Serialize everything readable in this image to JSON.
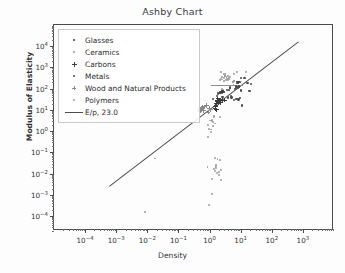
{
  "chart_data": {
    "type": "scatter",
    "title": "Ashby Chart",
    "xlabel": "Density",
    "ylabel": "Modulus of Elasticity",
    "xscale": "log",
    "yscale": "log",
    "xlim": [
      1e-05,
      10000
    ],
    "ylim": [
      2e-05,
      100000
    ],
    "grid": false,
    "legend_position": "upper left",
    "xticks": [
      {
        "value": 0.0001,
        "label": "10",
        "exp": "−4"
      },
      {
        "value": 0.001,
        "label": "10",
        "exp": "−3"
      },
      {
        "value": 0.01,
        "label": "10",
        "exp": "−2"
      },
      {
        "value": 0.1,
        "label": "10",
        "exp": "−1"
      },
      {
        "value": 1,
        "label": "10",
        "exp": "0"
      },
      {
        "value": 10,
        "label": "10",
        "exp": "1"
      },
      {
        "value": 100,
        "label": "10",
        "exp": "2"
      },
      {
        "value": 1000,
        "label": "10",
        "exp": "3"
      }
    ],
    "yticks": [
      {
        "value": 0.0001,
        "label": "10",
        "exp": "−4"
      },
      {
        "value": 0.001,
        "label": "10",
        "exp": "−3"
      },
      {
        "value": 0.01,
        "label": "10",
        "exp": "−2"
      },
      {
        "value": 0.1,
        "label": "10",
        "exp": "−1"
      },
      {
        "value": 1,
        "label": "10",
        "exp": "0"
      },
      {
        "value": 10,
        "label": "10",
        "exp": "1"
      },
      {
        "value": 100,
        "label": "10",
        "exp": "2"
      },
      {
        "value": 1000,
        "label": "10",
        "exp": "3"
      },
      {
        "value": 10000,
        "label": "10",
        "exp": "4"
      }
    ],
    "legend": [
      {
        "label": "Glasses",
        "marker": "dot",
        "color": "#3f3f3f",
        "size": 2.2
      },
      {
        "label": "Ceramics",
        "marker": "dot",
        "color": "#9a9a9a",
        "size": 1.8
      },
      {
        "label": "Carbons",
        "marker": "plus",
        "color": "#3a3a3a",
        "size": 5.0
      },
      {
        "label": "Metals",
        "marker": "dot",
        "color": "#4a4a4a",
        "size": 2.4
      },
      {
        "label": "Wood and Natural Products",
        "marker": "plus",
        "color": "#8a8a8a",
        "size": 4.6
      },
      {
        "label": "Polymers",
        "marker": "dot",
        "color": "#9e9e9e",
        "size": 1.9
      },
      {
        "label": "E/p, 23.0",
        "marker": "line",
        "color": "#4c4c4c",
        "size": 0
      }
    ],
    "guide_line": {
      "label": "E/p, 23.0",
      "slope_ratio": 23.0,
      "x_start": 0.0006,
      "y_start": 0.0026,
      "x_end": 700,
      "y_end": 16000,
      "color": "#4c4c4c"
    },
    "horizontal_marker": {
      "y": 150,
      "x_start": 1.1,
      "x_end": 12.0,
      "color": "#8e8e8e"
    },
    "series": [
      {
        "name": "Metals",
        "marker": "dot",
        "color": "#4a4a4a",
        "size": 2.3,
        "points": [
          [
            1.74,
            45
          ],
          [
            1.85,
            60
          ],
          [
            2.7,
            70
          ],
          [
            2.7,
            73
          ],
          [
            2.71,
            69
          ],
          [
            2.8,
            72
          ],
          [
            2.81,
            71
          ],
          [
            4.43,
            110
          ],
          [
            4.51,
            116
          ],
          [
            4.54,
            105
          ],
          [
            6.5,
            95
          ],
          [
            7.1,
            128
          ],
          [
            7.2,
            105
          ],
          [
            7.8,
            200
          ],
          [
            7.85,
            207
          ],
          [
            7.87,
            211
          ],
          [
            7.9,
            193
          ],
          [
            7.95,
            200
          ],
          [
            8.0,
            190
          ],
          [
            8.05,
            205
          ],
          [
            8.1,
            117
          ],
          [
            8.3,
            120
          ],
          [
            8.4,
            115
          ],
          [
            8.9,
            125
          ],
          [
            8.93,
            130
          ],
          [
            8.96,
            117
          ],
          [
            9.2,
            200
          ],
          [
            10.2,
            327
          ],
          [
            10.5,
            83
          ],
          [
            11.3,
            16
          ],
          [
            13.3,
            310
          ],
          [
            16.6,
            185
          ],
          [
            19.3,
            79
          ],
          [
            21.4,
            172
          ],
          [
            1.3,
            33
          ],
          [
            2.6,
            42
          ],
          [
            4.8,
            45
          ],
          [
            5.1,
            38
          ],
          [
            6.2,
            30
          ],
          [
            7.3,
            32
          ],
          [
            8.6,
            31
          ],
          [
            9.6,
            37
          ],
          [
            3.9,
            39
          ]
        ]
      },
      {
        "name": "Ceramics",
        "marker": "dot",
        "color": "#9a9a9a",
        "size": 1.9,
        "points": [
          [
            2.3,
            300
          ],
          [
            2.5,
            350
          ],
          [
            3.0,
            330
          ],
          [
            3.1,
            400
          ],
          [
            3.2,
            380
          ],
          [
            3.21,
            410
          ],
          [
            3.25,
            450
          ],
          [
            3.5,
            370
          ],
          [
            3.8,
            300
          ],
          [
            3.9,
            390
          ],
          [
            3.95,
            420
          ],
          [
            4.0,
            250
          ],
          [
            4.1,
            280
          ],
          [
            5.6,
            210
          ],
          [
            5.68,
            205
          ],
          [
            6.0,
            220
          ],
          [
            6.1,
            230
          ],
          [
            2.2,
            260
          ],
          [
            2.6,
            270
          ],
          [
            2.9,
            240
          ],
          [
            3.4,
            260
          ],
          [
            3.6,
            290
          ],
          [
            4.3,
            310
          ],
          [
            4.5,
            340
          ],
          [
            2.8,
            500
          ],
          [
            3.05,
            520
          ],
          [
            2.4,
            600
          ],
          [
            3.15,
            460
          ],
          [
            6.05,
            480
          ],
          [
            7.6,
            600
          ],
          [
            15.0,
            640
          ],
          [
            2.55,
            95
          ],
          [
            2.65,
            88
          ],
          [
            5.9,
            150
          ]
        ]
      },
      {
        "name": "Glasses",
        "marker": "dot",
        "color": "#3f3f3f",
        "size": 2.1,
        "points": [
          [
            2.2,
            64
          ],
          [
            2.23,
            70
          ],
          [
            2.4,
            68
          ],
          [
            2.5,
            72
          ],
          [
            2.52,
            74
          ],
          [
            2.55,
            66
          ],
          [
            2.6,
            78
          ],
          [
            3.6,
            90
          ],
          [
            4.28,
            85
          ],
          [
            2.18,
            60
          ]
        ]
      },
      {
        "name": "Carbons",
        "marker": "plus",
        "color": "#3a3a3a",
        "size": 4.6,
        "points": [
          [
            1.5,
            12
          ],
          [
            1.55,
            14
          ],
          [
            1.6,
            17
          ],
          [
            1.7,
            20
          ],
          [
            1.75,
            24
          ],
          [
            1.8,
            28
          ],
          [
            1.85,
            33
          ],
          [
            1.9,
            21
          ],
          [
            2.0,
            25
          ],
          [
            2.2,
            30
          ],
          [
            2.25,
            23
          ],
          [
            1.65,
            10
          ],
          [
            2.6,
            27
          ],
          [
            3.0,
            29
          ]
        ]
      },
      {
        "name": "Wood and Natural Products",
        "marker": "plus",
        "color": "#8a8a8a",
        "size": 4.4,
        "points": [
          [
            0.45,
            10
          ],
          [
            0.5,
            11
          ],
          [
            0.55,
            12
          ],
          [
            0.6,
            13
          ],
          [
            0.65,
            9
          ],
          [
            0.7,
            14
          ],
          [
            0.8,
            16
          ],
          [
            0.9,
            8
          ],
          [
            1.0,
            12
          ],
          [
            1.1,
            10
          ],
          [
            0.48,
            8.5
          ],
          [
            0.52,
            9.5
          ]
        ]
      },
      {
        "name": "Polymers",
        "marker": "dot",
        "color": "#9e9e9e",
        "size": 1.9,
        "points": [
          [
            1.05,
            3.2
          ],
          [
            1.2,
            3.4
          ],
          [
            1.3,
            2.6
          ],
          [
            1.4,
            4.6
          ],
          [
            1.5,
            2.3
          ],
          [
            1.18,
            2.9
          ],
          [
            1.25,
            1.8
          ],
          [
            1.38,
            5.0
          ],
          [
            2.2,
            4.5
          ],
          [
            0.92,
            2.0
          ],
          [
            0.95,
            1.3
          ],
          [
            1.1,
            1.2
          ],
          [
            1.15,
            0.9
          ],
          [
            0.91,
            0.52
          ],
          [
            1.5,
            0.055
          ],
          [
            1.8,
            0.05
          ],
          [
            2.1,
            0.045
          ],
          [
            1.55,
            0.02
          ],
          [
            1.6,
            0.019
          ],
          [
            1.58,
            0.022
          ],
          [
            1.62,
            0.026
          ],
          [
            2.4,
            0.015
          ],
          [
            0.86,
            0.021
          ],
          [
            1.2,
            0.0055
          ],
          [
            2.3,
            0.005
          ],
          [
            1.18,
            0.0011
          ],
          [
            0.95,
            0.00035
          ],
          [
            0.018,
            0.052
          ],
          [
            0.0085,
            0.00015
          ],
          [
            0.2,
            92
          ],
          [
            1.45,
            0.013
          ],
          [
            1.7,
            0.011
          ],
          [
            1.95,
            0.009
          ],
          [
            1.35,
            0.017
          ],
          [
            2.0,
            0.012
          ]
        ]
      }
    ]
  }
}
